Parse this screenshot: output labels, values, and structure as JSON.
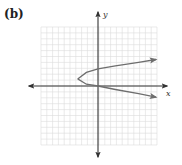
{
  "figure": {
    "panel_label": "(b)",
    "x_axis_label": "x",
    "y_axis_label": "y"
  },
  "colors": {
    "grid": "#dcdcdc",
    "axis": "#333333",
    "curve": "#6e6e6e",
    "panel_label": "#222222"
  },
  "chart_data": {
    "type": "line",
    "title": "(b)",
    "xlabel": "x",
    "ylabel": "y",
    "grid": true,
    "xlim": [
      -10,
      10
    ],
    "ylim": [
      -10,
      10
    ],
    "series": [
      {
        "name": "parabola",
        "points": [
          [
            10,
            4.5
          ],
          [
            7,
            4
          ],
          [
            3,
            3.4
          ],
          [
            0,
            2.9
          ],
          [
            -2,
            2.3
          ],
          [
            -3.5,
            1.2
          ],
          [
            -2,
            0.3
          ],
          [
            0,
            0
          ],
          [
            3,
            -0.6
          ],
          [
            7,
            -1.3
          ],
          [
            10,
            -1.9
          ]
        ]
      }
    ]
  }
}
